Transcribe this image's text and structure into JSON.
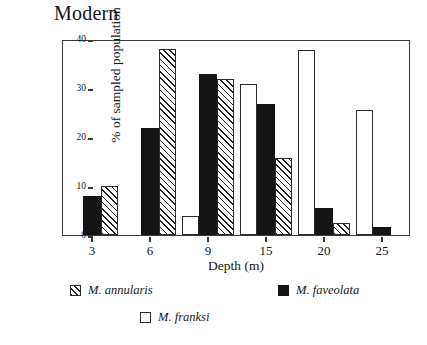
{
  "chart_data": {
    "type": "bar",
    "title": "Modern",
    "xlabel": "Depth (m)",
    "ylabel": "% of sampled population",
    "categories": [
      "3",
      "6",
      "9",
      "15",
      "20",
      "25"
    ],
    "ylim": [
      0,
      40
    ],
    "yticks": [
      "0",
      "10",
      "20",
      "30",
      "40"
    ],
    "grid": false,
    "legend_position": "bottom",
    "series": [
      {
        "name": "M. franksi",
        "style": "white",
        "values": [
          0,
          0,
          3.9,
          30.8,
          37.7,
          25.6
        ]
      },
      {
        "name": "M. faveolata",
        "style": "black",
        "values": [
          7.9,
          21.8,
          32.8,
          26.8,
          5.6,
          1.6
        ]
      },
      {
        "name": "M. annularis",
        "style": "hatch",
        "values": [
          10.0,
          37.9,
          31.8,
          15.8,
          2.5,
          0
        ]
      }
    ]
  },
  "legend": {
    "annularis_label": "M. annularis",
    "faveolata_label": "M. faveolata",
    "franksi_label": "M. franksi"
  }
}
